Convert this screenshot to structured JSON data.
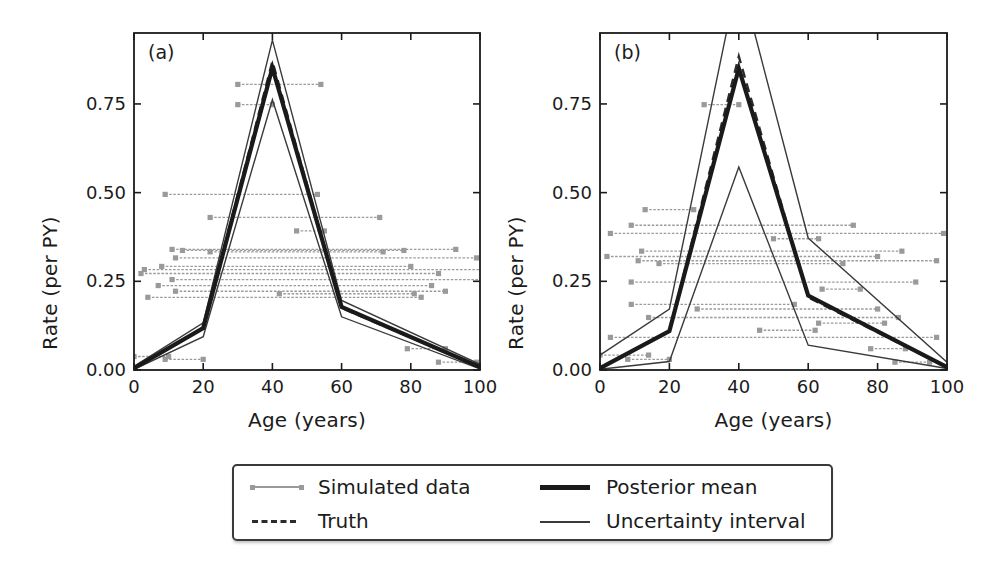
{
  "figure": {
    "panels": [
      {
        "tag": "(a)",
        "xlabel": "Age (years)",
        "ylabel": "Rate (per PY)",
        "xticks": [
          "0",
          "20",
          "40",
          "60",
          "80",
          "100"
        ],
        "yticks": [
          "0.00",
          "0.25",
          "0.50",
          "0.75"
        ]
      },
      {
        "tag": "(b)",
        "xlabel": "Age (years)",
        "ylabel": "Rate (per PY)",
        "xticks": [
          "0",
          "20",
          "40",
          "60",
          "80",
          "100"
        ],
        "yticks": [
          "0.00",
          "0.25",
          "0.50",
          "0.75"
        ]
      }
    ]
  },
  "legend": {
    "items": [
      {
        "label": "Simulated data",
        "style": "marker-line-gray"
      },
      {
        "label": "Truth",
        "style": "dashed-dark"
      },
      {
        "label": "Posterior mean",
        "style": "thick-solid-dark"
      },
      {
        "label": "Uncertainty interval",
        "style": "thin-solid-dark"
      }
    ]
  },
  "colors": {
    "axis": "#1b1b1b",
    "posterior_mean": "#1a1a1a",
    "truth": "#2b2b2b",
    "uncertainty": "#3a3a3a",
    "simulated_data": "#9a9a9a",
    "background": "#ffffff"
  },
  "chart_data": {
    "type": "line",
    "title": "",
    "xlabel": "Age (years)",
    "ylabel": "Rate (per PY)",
    "xlim": [
      0,
      100
    ],
    "ylim": [
      0.0,
      0.95
    ],
    "grid": false,
    "legend_position": "bottom-outside",
    "panels": [
      {
        "tag": "(a)",
        "x": [
          0,
          20,
          40,
          60,
          100
        ],
        "series": [
          {
            "name": "Posterior mean",
            "values": [
              0.005,
              0.118,
              0.852,
              0.178,
              0.008
            ],
            "style": "thick-solid-dark"
          },
          {
            "name": "Truth",
            "values": [
              0.005,
              0.118,
              0.87,
              0.175,
              0.008
            ],
            "style": "dashed-dark"
          },
          {
            "name": "Uncertainty interval upper",
            "values": [
              0.01,
              0.133,
              0.93,
              0.196,
              0.016
            ],
            "style": "thin-solid-dark"
          },
          {
            "name": "Uncertainty interval lower",
            "values": [
              0.002,
              0.094,
              0.762,
              0.15,
              0.003
            ],
            "style": "thin-solid-dark"
          }
        ],
        "simulated_data": [
          {
            "y": 0.805,
            "x_start": 30,
            "x_end": 54
          },
          {
            "y": 0.748,
            "x_start": 30,
            "x_end": 40
          },
          {
            "y": 0.495,
            "x_start": 9,
            "x_end": 53
          },
          {
            "y": 0.43,
            "x_start": 22,
            "x_end": 71
          },
          {
            "y": 0.392,
            "x_start": 47,
            "x_end": 55
          },
          {
            "y": 0.34,
            "x_start": 11,
            "x_end": 93
          },
          {
            "y": 0.337,
            "x_start": 14,
            "x_end": 78
          },
          {
            "y": 0.333,
            "x_start": 22,
            "x_end": 72
          },
          {
            "y": 0.316,
            "x_start": 12,
            "x_end": 99
          },
          {
            "y": 0.292,
            "x_start": 8,
            "x_end": 80
          },
          {
            "y": 0.283,
            "x_start": 3,
            "x_end": 101
          },
          {
            "y": 0.272,
            "x_start": 2,
            "x_end": 88
          },
          {
            "y": 0.255,
            "x_start": 11,
            "x_end": 101
          },
          {
            "y": 0.238,
            "x_start": 7,
            "x_end": 86
          },
          {
            "y": 0.222,
            "x_start": 12,
            "x_end": 90
          },
          {
            "y": 0.215,
            "x_start": 42,
            "x_end": 81
          },
          {
            "y": 0.205,
            "x_start": 4,
            "x_end": 83
          },
          {
            "y": 0.038,
            "x_start": 0,
            "x_end": 10
          },
          {
            "y": 0.03,
            "x_start": 9,
            "x_end": 20
          },
          {
            "y": 0.06,
            "x_start": 79,
            "x_end": 90
          },
          {
            "y": 0.022,
            "x_start": 88,
            "x_end": 99
          }
        ]
      },
      {
        "tag": "(b)",
        "x": [
          0,
          20,
          40,
          60,
          100
        ],
        "series": [
          {
            "name": "Posterior mean",
            "values": [
              0.005,
              0.11,
              0.85,
              0.21,
              0.008
            ],
            "style": "thick-solid-dark"
          },
          {
            "name": "Truth",
            "values": [
              0.005,
              0.11,
              0.884,
              0.205,
              0.008
            ],
            "style": "dashed-dark"
          },
          {
            "name": "Uncertainty interval upper",
            "values": [
              0.042,
              0.172,
              1.12,
              0.372,
              0.022
            ],
            "style": "thin-solid-dark"
          },
          {
            "name": "Uncertainty interval lower",
            "values": [
              0.002,
              0.024,
              0.572,
              0.07,
              0.004
            ],
            "style": "thin-solid-dark"
          }
        ],
        "simulated_data": [
          {
            "y": 0.748,
            "x_start": 30,
            "x_end": 40
          },
          {
            "y": 0.452,
            "x_start": 13,
            "x_end": 27
          },
          {
            "y": 0.408,
            "x_start": 9,
            "x_end": 73
          },
          {
            "y": 0.385,
            "x_start": 3,
            "x_end": 99
          },
          {
            "y": 0.37,
            "x_start": 50,
            "x_end": 63
          },
          {
            "y": 0.335,
            "x_start": 12,
            "x_end": 87
          },
          {
            "y": 0.32,
            "x_start": 2,
            "x_end": 80
          },
          {
            "y": 0.308,
            "x_start": 11,
            "x_end": 97
          },
          {
            "y": 0.3,
            "x_start": 17,
            "x_end": 70
          },
          {
            "y": 0.248,
            "x_start": 9,
            "x_end": 91
          },
          {
            "y": 0.228,
            "x_start": 64,
            "x_end": 75
          },
          {
            "y": 0.185,
            "x_start": 9,
            "x_end": 56
          },
          {
            "y": 0.172,
            "x_start": 28,
            "x_end": 80
          },
          {
            "y": 0.148,
            "x_start": 14,
            "x_end": 86
          },
          {
            "y": 0.132,
            "x_start": 63,
            "x_end": 82
          },
          {
            "y": 0.112,
            "x_start": 46,
            "x_end": 62
          },
          {
            "y": 0.092,
            "x_start": 3,
            "x_end": 97
          },
          {
            "y": 0.06,
            "x_start": 78,
            "x_end": 88
          },
          {
            "y": 0.042,
            "x_start": 0,
            "x_end": 14
          },
          {
            "y": 0.03,
            "x_start": 8,
            "x_end": 20
          },
          {
            "y": 0.022,
            "x_start": 85,
            "x_end": 95
          }
        ]
      }
    ]
  }
}
